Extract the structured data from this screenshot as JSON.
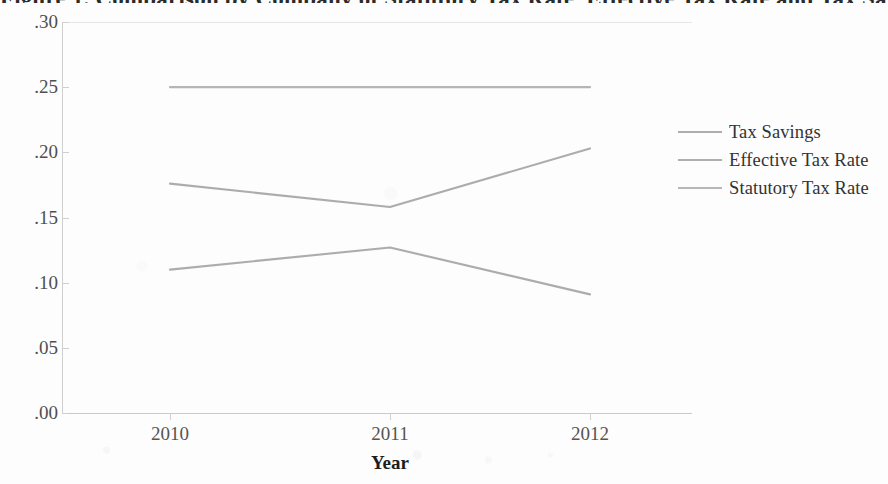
{
  "chart_data": {
    "type": "line",
    "title": "Figure 1. Comparison by Company of Statutory Tax Rate, Effective Tax Rate and Tax Savings",
    "xlabel": "Year",
    "ylabel": "",
    "categories": [
      "2010",
      "2011",
      "2012"
    ],
    "xtick_labels": [
      "2010",
      "2011",
      "2012"
    ],
    "ytick_labels": [
      ".30",
      ".25",
      ".20",
      ".15",
      ".10",
      ".05",
      ".00"
    ],
    "ytick_values": [
      0.3,
      0.25,
      0.2,
      0.15,
      0.1,
      0.05,
      0.0
    ],
    "ylim": [
      0.0,
      0.3
    ],
    "grid": false,
    "legend_position": "right",
    "series": [
      {
        "name": "Tax Savings",
        "values": [
          0.11,
          0.127,
          0.091
        ],
        "color": "#9a9a9a"
      },
      {
        "name": "Effective Tax Rate",
        "values": [
          0.176,
          0.158,
          0.203
        ],
        "color": "#9a9a9a"
      },
      {
        "name": "Statutory Tax Rate",
        "values": [
          0.25,
          0.25,
          0.25
        ],
        "color": "#a5a5a5"
      }
    ]
  },
  "legend": {
    "items": [
      {
        "label": "Tax Savings"
      },
      {
        "label": "Effective Tax Rate"
      },
      {
        "label": "Statutory Tax Rate"
      }
    ]
  },
  "axes": {
    "x_title": "Year"
  }
}
